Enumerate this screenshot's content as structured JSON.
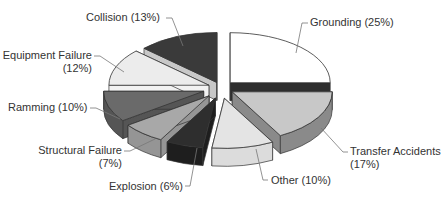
{
  "chart_data": {
    "type": "pie",
    "title": "",
    "style": "3d-exploded",
    "categories": [
      "Grounding",
      "Transfer Accidents",
      "Other",
      "Explosion",
      "Structural Failure",
      "Ramming",
      "Equipment Failure",
      "Collision"
    ],
    "values": [
      25,
      17,
      10,
      6,
      7,
      10,
      12,
      13
    ],
    "unit": "%",
    "colors": [
      "#ffffff",
      "#c8c8c8",
      "#e4e4e4",
      "#2e2e2e",
      "#a8a8a8",
      "#6a6a6a",
      "#ececec",
      "#3a3a3a"
    ],
    "legend": "none (callout labels)"
  },
  "labels": {
    "grounding": "Grounding (25%)",
    "transfer_1": "Transfer Accidents",
    "transfer_2": "(17%)",
    "other": "Other (10%)",
    "explosion": "Explosion (6%)",
    "structural_1": "Structural Failure",
    "structural_2": "(7%)",
    "ramming": "Ramming (10%)",
    "equipment_1": "Equipment Failure",
    "equipment_2": "(12%)",
    "collision": "Collision (13%)"
  }
}
